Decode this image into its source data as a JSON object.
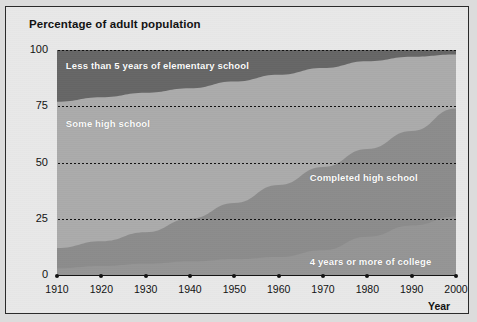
{
  "figure": {
    "title": "Percentage of adult population",
    "x_axis_title": "Year"
  },
  "chart_data": {
    "type": "area",
    "stacked": true,
    "stack_order": "top-to-bottom",
    "title": "Percentage of adult population",
    "xlabel": "Year",
    "ylabel": "Percentage of adult population",
    "xlim": [
      1910,
      2000
    ],
    "ylim": [
      0,
      100
    ],
    "grid": "horizontal-dotted",
    "legend": "inline-labels",
    "x": [
      1910,
      1920,
      1930,
      1940,
      1950,
      1960,
      1970,
      1980,
      1990,
      2000
    ],
    "xticklabels": [
      "1910",
      "1920",
      "1930",
      "1940",
      "1950",
      "1960",
      "1970",
      "1980",
      "1990",
      "2000"
    ],
    "yticks": [
      0,
      25,
      50,
      75,
      100
    ],
    "yticklabels": [
      "0",
      "25",
      "50",
      "75",
      "100"
    ],
    "series": [
      {
        "name": "Less than 5 years of elementary school",
        "color": "#666666",
        "values": [
          23,
          21,
          19,
          17,
          14,
          11,
          8,
          5,
          3,
          2
        ],
        "label_x": 1912,
        "label_y": 93
      },
      {
        "name": "Some high school",
        "color": "#ababab",
        "values": [
          65,
          63,
          60,
          56,
          51,
          49,
          45,
          38,
          30,
          24
        ],
        "label_x": 1912,
        "label_y": 67
      },
      {
        "name": "Completed high school",
        "color": "#8c8c8c",
        "values": [
          9,
          11,
          14,
          19,
          25,
          34,
          37,
          39,
          43,
          47
        ],
        "label_x": 1967,
        "label_y": 43
      },
      {
        "name": "4 years or more of college",
        "color": "#959595",
        "values": [
          3,
          5,
          7,
          8,
          10,
          6,
          10,
          18,
          24,
          27
        ],
        "label_x": 1967,
        "label_y": 6
      }
    ],
    "cumulative_top_boundaries_from_bottom": {
      "note": "upper edge of each band measured from 0, percent",
      "4 years or more of college": [
        3,
        4,
        5,
        6,
        7,
        8,
        11,
        17,
        22,
        26
      ],
      "Completed high school": [
        12,
        15,
        19,
        25,
        32,
        40,
        48,
        56,
        64,
        74
      ],
      "Some high school": [
        77,
        79,
        81,
        83,
        86,
        89,
        92,
        95,
        97,
        98
      ],
      "Less than 5 years of elementary school": [
        100,
        100,
        100,
        100,
        100,
        100,
        100,
        100,
        100,
        100
      ]
    }
  },
  "colors": {
    "background": "#dcdcdc",
    "panel": "#e8e8e8",
    "border": "#2b2b2b",
    "text": "#111111",
    "band_dark": "#666666",
    "band_light": "#ababab",
    "band_mid": "#8c8c8c",
    "band_bottom": "#959595",
    "label_text": "#fdfdfd"
  }
}
